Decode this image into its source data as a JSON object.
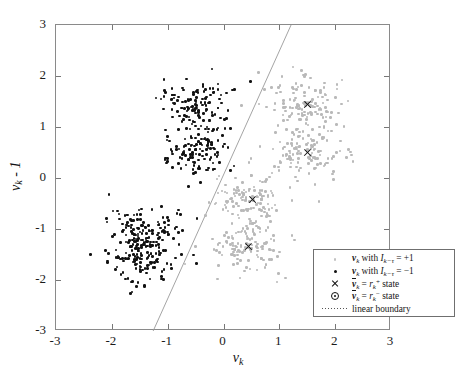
{
  "chart_data": {
    "type": "scatter",
    "title": "",
    "xlabel": "v_k",
    "ylabel": "v_k - 1",
    "xlim": [
      -3,
      3
    ],
    "ylim": [
      -3,
      3
    ],
    "xticks": [
      "-3",
      "-2",
      "-1",
      "0",
      "1",
      "2",
      "3"
    ],
    "yticks": [
      "3",
      "2",
      "1",
      "0",
      "-1",
      "-2",
      "-3"
    ],
    "xtick_values": [
      -3,
      -2,
      -1,
      0,
      1,
      2,
      3
    ],
    "ytick_values": [
      3,
      2,
      1,
      0,
      -1,
      -2,
      -3
    ],
    "grid": false,
    "legend_position": "lower right",
    "series": [
      {
        "name": "v_k with I_{k-tau} = +1",
        "marker": "dot",
        "color": "#b9b9b9",
        "cluster_centers": [
          [
            1.5,
            1.45
          ],
          [
            1.5,
            0.5
          ],
          [
            0.52,
            -0.42
          ],
          [
            0.45,
            -1.35
          ]
        ],
        "cluster_spread": [
          0.34,
          0.34,
          0.34,
          0.34
        ],
        "points_per_cluster": [
          120,
          120,
          120,
          120
        ]
      },
      {
        "name": "v_k with I_{k-tau} = -1",
        "marker": "dot",
        "color": "#121212",
        "cluster_centers": [
          [
            -0.52,
            1.42
          ],
          [
            -0.52,
            0.5
          ],
          [
            -1.42,
            -1.0
          ],
          [
            -1.42,
            -1.58
          ]
        ],
        "cluster_spread": [
          0.32,
          0.32,
          0.32,
          0.32
        ],
        "points_per_cluster": [
          120,
          120,
          120,
          120
        ]
      },
      {
        "name": "vbar_k = r_k^+ state",
        "marker": "x",
        "color": "#111111",
        "points": [
          [
            1.5,
            1.45
          ],
          [
            1.5,
            0.5
          ],
          [
            0.52,
            -0.42
          ],
          [
            0.45,
            -1.35
          ]
        ]
      }
    ],
    "annotations": [
      {
        "name": "linear boundary",
        "type": "line",
        "style": "dotted",
        "color": "#9a9a9a",
        "from": [
          1.21,
          3.0
        ],
        "to": [
          -1.26,
          -3.0
        ]
      }
    ]
  },
  "axes": {
    "x_title_base": "v",
    "x_title_sub": "k",
    "y_title_base": "v",
    "y_title_sub": "k",
    "y_title_tail": " - 1",
    "xticks": [
      "-3",
      "-2",
      "-1",
      "0",
      "1",
      "2",
      "3"
    ],
    "yticks": [
      "3",
      "2",
      "1",
      "0",
      "-1",
      "-2",
      "-3"
    ]
  },
  "legend": {
    "rows": [
      {
        "key": "light-dot-icon",
        "text_parts": {
          "vec": "v",
          "sub": "k",
          "mid": " with ",
          "sym": "I",
          "sym_sub": "k−τ",
          "eq": " = +1"
        }
      },
      {
        "key": "dark-dot-icon",
        "text_parts": {
          "vec": "v",
          "sub": "k",
          "mid": " with ",
          "sym": "I",
          "sym_sub": "k−τ",
          "eq": " = −1"
        }
      },
      {
        "key": "x-marker-icon",
        "text_parts": {
          "vec": "v",
          "sub": "k",
          "mid": " = ",
          "sym": "r",
          "sym_sub": "k",
          "sym_sup": "+",
          "eq": " state"
        }
      },
      {
        "key": "circle-dot-marker-icon",
        "text_parts": {
          "vec": "v",
          "sub": "k",
          "mid": " = ",
          "sym": "r",
          "sym_sub": "k",
          "sym_sup": "−",
          "eq": " state"
        }
      },
      {
        "key": "dotted-line-icon",
        "text_parts": {
          "plain": "linear boundary"
        }
      }
    ]
  }
}
